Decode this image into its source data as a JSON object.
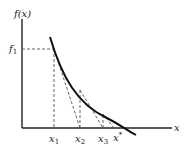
{
  "diagram": {
    "y_axis_label": "f(x)",
    "x_axis_label": "x",
    "f1_label": {
      "base": "f",
      "sub": "1"
    },
    "x_ticks": [
      {
        "base": "x",
        "sub": "1"
      },
      {
        "base": "x",
        "sub": "2"
      },
      {
        "base": "x",
        "sub": "3"
      },
      {
        "base": "x",
        "sup": "*"
      }
    ],
    "colors": {
      "curve": "#111111",
      "axes": "#222222",
      "dashed": "#555555"
    }
  }
}
